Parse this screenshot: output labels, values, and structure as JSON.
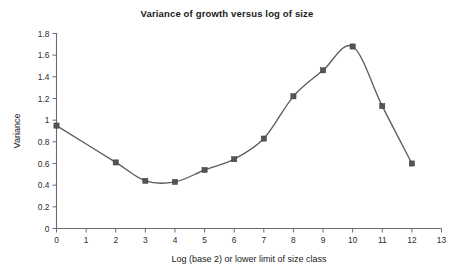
{
  "chart_data": {
    "type": "line",
    "title": "Variance of growth versus log of size",
    "xlabel": "Log (base 2) or lower limit of size class",
    "ylabel": "Variance",
    "x": [
      0,
      2,
      3,
      4,
      5,
      6,
      7,
      8,
      9,
      10,
      11,
      12
    ],
    "values": [
      0.95,
      0.61,
      0.44,
      0.43,
      0.54,
      0.64,
      0.83,
      1.22,
      1.46,
      1.68,
      1.13,
      0.6
    ],
    "series": [
      {
        "name": "Variance",
        "x": [
          0,
          2,
          3,
          4,
          5,
          6,
          7,
          8,
          9,
          10,
          11,
          12
        ],
        "values": [
          0.95,
          0.61,
          0.44,
          0.43,
          0.54,
          0.64,
          0.83,
          1.22,
          1.46,
          1.68,
          1.13,
          0.6
        ]
      }
    ],
    "xlim": [
      0,
      13
    ],
    "ylim": [
      0,
      1.8
    ],
    "xticks": [
      "0",
      "1",
      "2",
      "3",
      "4",
      "5",
      "6",
      "7",
      "8",
      "9",
      "10",
      "11",
      "12",
      "13"
    ],
    "xtick_values": [
      0,
      1,
      2,
      3,
      4,
      5,
      6,
      7,
      8,
      9,
      10,
      11,
      12,
      13
    ],
    "yticks": [
      "0",
      "0.2",
      "0.4",
      "0.6",
      "0.8",
      "1",
      "1.2",
      "1.4",
      "1.6",
      "1.8"
    ],
    "ytick_values": [
      0,
      0.2,
      0.4,
      0.6,
      0.8,
      1.0,
      1.2,
      1.4,
      1.6,
      1.8
    ],
    "grid": false,
    "legend": false,
    "marker": "square",
    "line_color": "#5d5d5d",
    "marker_color": "#545454",
    "axis_color": "#6b6b6b",
    "background_color": "#ffffff",
    "smoothing": "curved"
  }
}
